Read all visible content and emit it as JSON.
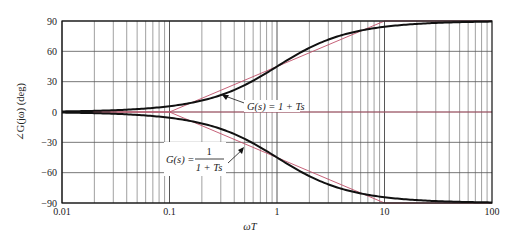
{
  "chart_data": {
    "type": "line",
    "title": "",
    "xlabel": "ωT",
    "ylabel": "∠G(jω) (deg)",
    "xscale": "log",
    "xlim": [
      0.01,
      100
    ],
    "ylim": [
      -90,
      90
    ],
    "xticks": [
      0.01,
      0.1,
      1,
      10,
      100
    ],
    "xtick_labels": [
      "0.01",
      "0.1",
      "1",
      "10",
      "100"
    ],
    "yticks": [
      90,
      60,
      30,
      0,
      -30,
      -60,
      -90
    ],
    "ytick_labels": [
      "90",
      "60",
      "30",
      "0",
      "−30",
      "−60",
      "−90"
    ],
    "grid": true,
    "series": [
      {
        "name": "G(s) = 1 + Ts",
        "style": "exact",
        "color": "#111111",
        "x": [
          0.01,
          0.05,
          0.1,
          0.2,
          0.5,
          1,
          2,
          5,
          10,
          20,
          50,
          100
        ],
        "values": [
          0.6,
          2.9,
          5.7,
          11.3,
          26.6,
          45,
          63.4,
          78.7,
          84.3,
          87.1,
          88.9,
          89.4
        ]
      },
      {
        "name": "G(s) = 1/(1 + Ts)",
        "style": "exact",
        "color": "#111111",
        "x": [
          0.01,
          0.05,
          0.1,
          0.2,
          0.5,
          1,
          2,
          5,
          10,
          20,
          50,
          100
        ],
        "values": [
          -0.6,
          -2.9,
          -5.7,
          -11.3,
          -26.6,
          -45,
          -63.4,
          -78.7,
          -84.3,
          -87.1,
          -88.9,
          -89.4
        ]
      },
      {
        "name": "Lead asymptote",
        "style": "asymptote",
        "color": "#c0506a",
        "x": [
          0.01,
          0.1,
          10,
          100
        ],
        "values": [
          0,
          0,
          90,
          90
        ]
      },
      {
        "name": "Lag asymptote",
        "style": "asymptote",
        "color": "#c0506a",
        "x": [
          0.01,
          0.1,
          10,
          100
        ],
        "values": [
          0,
          0,
          -90,
          -90
        ]
      }
    ],
    "annotations": [
      {
        "text_prefix": "G(s) = 1 + Ts",
        "points_to": [
          0.2,
          12
        ]
      },
      {
        "text_prefix": "G(s) =",
        "numerator": "1",
        "denominator": "1 + Ts",
        "points_to": [
          0.5,
          -25
        ]
      }
    ],
    "zero_line_color": "#c0506a"
  },
  "labels": {
    "ylabel": "∠G(jω) (deg)",
    "xlabel": "ωT",
    "lead_label": "G(s) = 1 + Ts",
    "lag_prefix": "G(s) =",
    "lag_num": "1",
    "lag_den": "1 + Ts"
  }
}
